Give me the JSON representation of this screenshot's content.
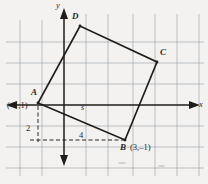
{
  "figure": {
    "background_color": "#f3f2f0",
    "ink_color": "#2a2724",
    "grid_color": "#9aa3ae",
    "axis_color": "#1f1c1a"
  },
  "axes": {
    "x_label": "x",
    "y_label": "y",
    "origin_px": [
      64,
      105
    ]
  },
  "grid": {
    "spacing_px": 21.6,
    "vertical_lines_px": [
      20,
      42,
      64,
      86,
      108,
      133,
      155,
      177,
      199
    ],
    "horizontal_lines_px": [
      42,
      63,
      84,
      105,
      126,
      147,
      168
    ]
  },
  "vertices": [
    {
      "name": "A",
      "label": "A",
      "coord_label": "(–1,1)",
      "px": [
        38,
        103
      ],
      "label_px": [
        32,
        95
      ],
      "coord_px": [
        8,
        106
      ]
    },
    {
      "name": "B",
      "label": "B",
      "coord_label": "(3,–1)",
      "px": [
        125,
        140
      ],
      "label_px": [
        122,
        140
      ],
      "coord_px": [
        131,
        141
      ]
    },
    {
      "name": "C",
      "label": "C",
      "coord_label": "",
      "px": [
        157,
        62
      ],
      "label_px": [
        160,
        53
      ],
      "coord_px": null
    },
    {
      "name": "D",
      "label": "D",
      "coord_label": "",
      "px": [
        80,
        26
      ],
      "label_px": [
        73,
        17
      ],
      "coord_px": null
    }
  ],
  "quadrilateral": {
    "order": [
      "A",
      "B",
      "C",
      "D"
    ],
    "stroke_width": 1.6,
    "closed": true
  },
  "annotations": [
    {
      "name": "tick-label-2",
      "text": "2",
      "px": [
        30,
        130
      ],
      "style": "tick-lbl"
    },
    {
      "name": "tick-label-4",
      "text": "4",
      "px": [
        80,
        136
      ],
      "style": "tick-lbl"
    },
    {
      "name": "segment-label-s",
      "text": "s",
      "px": [
        82,
        107
      ],
      "style": "seg-lbl"
    }
  ],
  "dashed_guides": [
    {
      "name": "horizontal-guide-to-B",
      "from_px": [
        30,
        140
      ],
      "to_px": [
        125,
        140
      ]
    },
    {
      "name": "vertical-guide-from-A",
      "from_px": [
        38,
        105
      ],
      "to_px": [
        38,
        142
      ]
    }
  ]
}
